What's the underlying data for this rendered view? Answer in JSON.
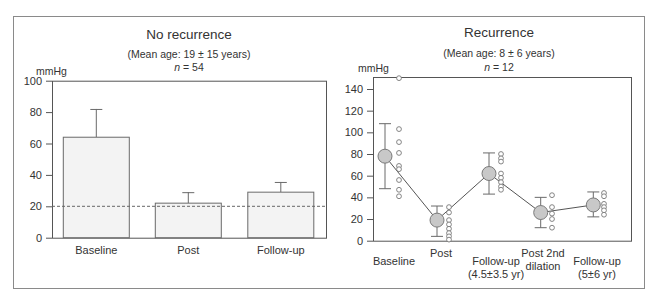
{
  "colors": {
    "frame": "#8a8a8a",
    "axis": "#555555",
    "bar_fill": "#f3f3f3",
    "bar_stroke": "#6a6a6a",
    "mean_fill": "#c8c8c8",
    "mean_stroke": "#7a7a7a",
    "point_stroke": "#777777",
    "line": "#555555",
    "dashed": "#666666",
    "text": "#333333"
  },
  "left_panel": {
    "title": "No recurrence",
    "subtitle": "(Mean age: 19 ± 15 years)",
    "n_label": "n",
    "n_value": " = 54",
    "unit": "mmHg"
  },
  "right_panel": {
    "title": "Recurrence",
    "subtitle": "(Mean age: 8 ± 6 years)",
    "n_label": "n",
    "n_value": " = 12",
    "unit": "mmHg"
  },
  "chart_data": [
    {
      "type": "bar",
      "title": "No recurrence",
      "subtitle": "(Mean age: 19 ± 15 years), n = 54",
      "xlabel": "",
      "ylabel": "mmHg",
      "ylim": [
        0,
        100
      ],
      "yticks": [
        0,
        20,
        40,
        60,
        80,
        100
      ],
      "categories": [
        "Baseline",
        "Post",
        "Follow-up"
      ],
      "values": [
        64,
        22,
        29
      ],
      "error_upper": [
        82,
        29,
        35.5
      ],
      "reference_line": {
        "y": 20,
        "style": "dashed"
      },
      "grid": false
    },
    {
      "type": "scatter",
      "title": "Recurrence",
      "subtitle": "(Mean age: 8 ± 6 years), n = 12",
      "xlabel": "",
      "ylabel": "mmHg",
      "ylim": [
        0,
        150
      ],
      "yticks": [
        0,
        20,
        40,
        60,
        80,
        100,
        120,
        140
      ],
      "categories": [
        [
          "Baseline"
        ],
        [
          "Post"
        ],
        [
          "Follow-up",
          "(4.5±3.5 yr)"
        ],
        [
          "Post 2nd",
          "dilation"
        ],
        [
          "Follow-up",
          "(5±6 yr)"
        ]
      ],
      "series": [
        {
          "name": "Mean ± SD",
          "values": [
            78,
            19,
            62,
            26,
            33
          ],
          "error_low": [
            48,
            4,
            43,
            12,
            22
          ],
          "error_high": [
            108,
            32,
            81,
            40,
            45
          ],
          "connected": true
        },
        {
          "name": "Individual patients",
          "values": [
            [
              150,
              103,
              91,
              81,
              69,
              66,
              56,
              47,
              41
            ],
            [
              31,
              26,
              19,
              15,
              11,
              7,
              4,
              1
            ],
            [
              80,
              76,
              73,
              62,
              58,
              54,
              50,
              47
            ],
            [
              42,
              31,
              25,
              20,
              12
            ],
            [
              44,
              41,
              34,
              31,
              28,
              24
            ]
          ]
        }
      ],
      "grid": false
    }
  ]
}
